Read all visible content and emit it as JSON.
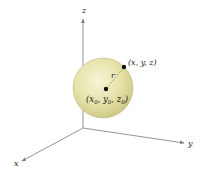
{
  "diagram": {
    "axes": {
      "x": {
        "label": "x"
      },
      "y": {
        "label": "y"
      },
      "z": {
        "label": "z"
      }
    },
    "sphere": {
      "fill_color": "#e8e6b0",
      "edge_color": "#b5b27a"
    },
    "center_point": {
      "label_x": "x",
      "label_y": "y",
      "label_z": "z",
      "subscript": "0",
      "open_paren": "(",
      "comma": ", ",
      "close_paren": ")"
    },
    "surface_point": {
      "label": "(x, y, z)"
    },
    "radius": {
      "label": "r"
    },
    "colors": {
      "axis": "#8a8a8a",
      "point": "#111111",
      "radius_line": "#b0a070"
    }
  }
}
